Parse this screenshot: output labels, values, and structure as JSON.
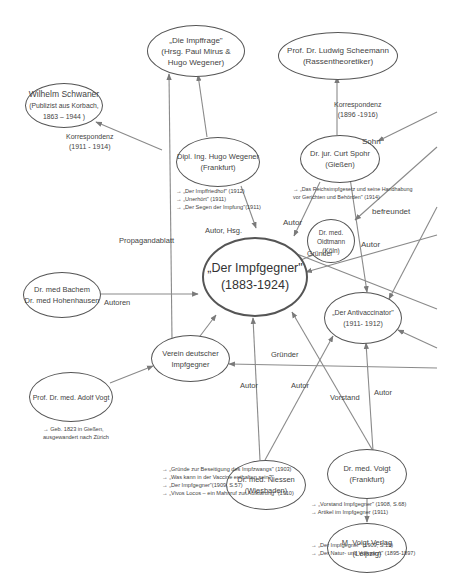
{
  "diagram": {
    "nodes": {
      "impffrage": {
        "lines": [
          "„Die Impffrage\"",
          "(Hrsg. Paul Mirus &",
          "Hugo Wegener)"
        ]
      },
      "scheemann": {
        "lines": [
          "Prof. Dr. Ludwig Scheemann",
          "(Rassentheoretiker)"
        ]
      },
      "schwaner": {
        "lines": [
          "Wilhelm Schwaner",
          "(Publizist aus Korbach,",
          "1863 – 1944 )"
        ]
      },
      "wegener": {
        "lines": [
          "Dipl. Ing. Hugo Wegener",
          "(Frankfurt)"
        ]
      },
      "spohr": {
        "lines": [
          "Dr. jur. Curt Spohr",
          "(Gießen)"
        ]
      },
      "oidtmann": {
        "lines": [
          "Dr. med.",
          "Oidtmann",
          "(Köln)"
        ]
      },
      "impfgegner": {
        "lines": [
          "„Der Impfgegner\"",
          "(1883-1924)"
        ]
      },
      "bachem": {
        "lines": [
          "Dr. med Bachem",
          "Dr. med Hohenhausen"
        ]
      },
      "antivaccinator": {
        "lines": [
          "„Der Antivaccinator\"",
          "(1911- 1912)"
        ]
      },
      "verein": {
        "lines": [
          "Verein deutscher",
          "Impfgegner"
        ]
      },
      "vogt": {
        "lines": [
          "Prof. Dr. med. Adolf Vogt"
        ]
      },
      "niessen": {
        "lines": [
          "Dr. med. Niessen",
          "(Wiesbaden)"
        ]
      },
      "voigt": {
        "lines": [
          "Dr. med. Voigt",
          "(Frankfurt)"
        ]
      },
      "verlag": {
        "lines": [
          "M. Voigt Verlag",
          "(Leipzig)"
        ]
      }
    },
    "edge_labels": {
      "schwaner_korr": [
        "Korrespondenz",
        "(1911 - 1914)"
      ],
      "scheemann_korr": [
        "Korrespondenz",
        "(1896 -1916)"
      ],
      "sohn": "Sohn",
      "befreundet": "befreundet",
      "autor_hsg": "Autor, Hsg.",
      "propagandablatt": "Propagandablatt",
      "spohr_autor": "Autor",
      "oidtmann_autor": "Autor",
      "gruender_oidtmann": "Gründer",
      "autoren": "Autoren",
      "gruender_verein": "Gründer",
      "niessen_autor1": "Autor",
      "niessen_autor2": "Autor",
      "vorstand": "Vorstand",
      "voigt_autor": "Autor"
    },
    "references": {
      "wegener": [
        "→ „Der Impffriedhof\" (1912)",
        "→ „Unerhört\" (1911)",
        "→ „Der Segen der Impfung\"(1911)"
      ],
      "spohr": [
        "→ „Das Reichsimpfgesetz und seine Handhabung",
        "vor Gerichten und Behörden\" (1914)"
      ],
      "vogt": [
        "→ Geb. 1823 in Gießen,",
        "ausgewandert nach Zürich"
      ],
      "niessen": [
        "→ „Gründe zur Beseitigung des Impfzwangs\" (1903)",
        "→ „Was kann in der Vaccine enthalten sein?\"",
        "→ „Der Impfgegner\"(1909, S.57)",
        "→ „Vivos Locos – ein Mahnruf zur Aufklärung\" (1910)"
      ],
      "voigt": [
        "→ „Vorstand Impfgegner\" (1908, S.68)",
        "→ Artikel im Impfgegner (1911)"
      ],
      "verlag": [
        "→ „Der Impfgegner\" (1909, S.19)",
        "→ „Der Natur- und Volksarzt\" (1895-1897)"
      ]
    },
    "colors": {
      "line": "#808080",
      "border": "#555555",
      "text": "#444444"
    }
  }
}
